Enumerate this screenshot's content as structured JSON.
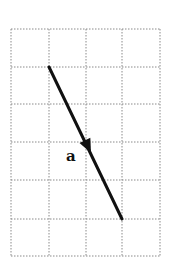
{
  "diagram": {
    "type": "vector-on-grid",
    "grid": {
      "columns": 4,
      "rows": 6,
      "line_style": "dotted",
      "line_color": "#8a8a8a"
    },
    "vector": {
      "label": "a",
      "start_cell": [
        1,
        1
      ],
      "end_cell": [
        3,
        5
      ],
      "direction": "down-right",
      "color": "#111111"
    }
  }
}
